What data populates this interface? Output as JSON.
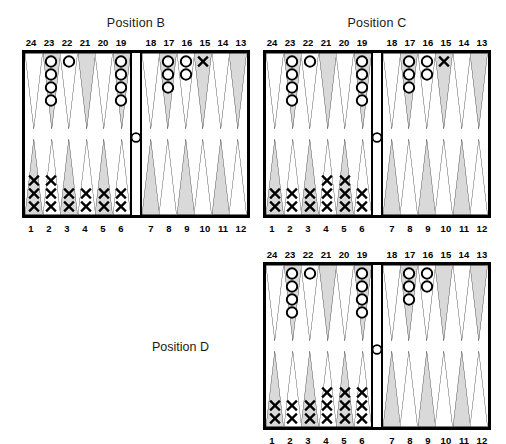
{
  "page": {
    "width": 506,
    "height": 444,
    "background": "#ffffff",
    "colors": {
      "ink": "#000000",
      "point_shaded": "#d9d9d9",
      "point_plain": "#ffffff",
      "board_border": "#000000",
      "checker_o": "#ffffff",
      "checker_x": "#000000"
    }
  },
  "top_point_numbers": [
    "24",
    "23",
    "22",
    "21",
    "20",
    "19",
    "18",
    "17",
    "16",
    "15",
    "14",
    "13"
  ],
  "bottom_point_numbers": [
    "1",
    "2",
    "3",
    "4",
    "5",
    "6",
    "7",
    "8",
    "9",
    "10",
    "11",
    "12"
  ],
  "boards": [
    {
      "id": "position-b",
      "title": "Position B",
      "title_placement": "above",
      "checkers": {
        "24": {
          "type": "",
          "count": 0
        },
        "23": {
          "type": "O",
          "count": 4
        },
        "22": {
          "type": "O",
          "count": 1
        },
        "21": {
          "type": "",
          "count": 0
        },
        "20": {
          "type": "",
          "count": 0
        },
        "19": {
          "type": "O",
          "count": 4
        },
        "18": {
          "type": "",
          "count": 0
        },
        "17": {
          "type": "O",
          "count": 3
        },
        "16": {
          "type": "O",
          "count": 2
        },
        "15": {
          "type": "X",
          "count": 1
        },
        "14": {
          "type": "",
          "count": 0
        },
        "13": {
          "type": "",
          "count": 0
        },
        "12": {
          "type": "",
          "count": 0
        },
        "11": {
          "type": "",
          "count": 0
        },
        "10": {
          "type": "",
          "count": 0
        },
        "9": {
          "type": "",
          "count": 0
        },
        "8": {
          "type": "",
          "count": 0
        },
        "7": {
          "type": "",
          "count": 0
        },
        "6": {
          "type": "X",
          "count": 2
        },
        "5": {
          "type": "X",
          "count": 2
        },
        "4": {
          "type": "X",
          "count": 2
        },
        "3": {
          "type": "X",
          "count": 2
        },
        "2": {
          "type": "X",
          "count": 3
        },
        "1": {
          "type": "X",
          "count": 3
        }
      },
      "bar": {
        "type": "O",
        "count": 1
      }
    },
    {
      "id": "position-c",
      "title": "Position C",
      "title_placement": "above",
      "checkers": {
        "24": {
          "type": "",
          "count": 0
        },
        "23": {
          "type": "O",
          "count": 4
        },
        "22": {
          "type": "O",
          "count": 1
        },
        "21": {
          "type": "",
          "count": 0
        },
        "20": {
          "type": "",
          "count": 0
        },
        "19": {
          "type": "O",
          "count": 4
        },
        "18": {
          "type": "",
          "count": 0
        },
        "17": {
          "type": "O",
          "count": 3
        },
        "16": {
          "type": "O",
          "count": 2
        },
        "15": {
          "type": "X",
          "count": 1
        },
        "14": {
          "type": "",
          "count": 0
        },
        "13": {
          "type": "",
          "count": 0
        },
        "12": {
          "type": "",
          "count": 0
        },
        "11": {
          "type": "",
          "count": 0
        },
        "10": {
          "type": "",
          "count": 0
        },
        "9": {
          "type": "",
          "count": 0
        },
        "8": {
          "type": "",
          "count": 0
        },
        "7": {
          "type": "",
          "count": 0
        },
        "6": {
          "type": "X",
          "count": 2
        },
        "5": {
          "type": "X",
          "count": 3
        },
        "4": {
          "type": "X",
          "count": 3
        },
        "3": {
          "type": "X",
          "count": 2
        },
        "2": {
          "type": "X",
          "count": 2
        },
        "1": {
          "type": "X",
          "count": 2
        }
      },
      "bar": {
        "type": "O",
        "count": 1
      }
    },
    {
      "id": "position-d",
      "title": "Position D",
      "title_placement": "left",
      "checkers": {
        "24": {
          "type": "",
          "count": 0
        },
        "23": {
          "type": "O",
          "count": 4
        },
        "22": {
          "type": "O",
          "count": 1
        },
        "21": {
          "type": "",
          "count": 0
        },
        "20": {
          "type": "",
          "count": 0
        },
        "19": {
          "type": "O",
          "count": 4
        },
        "18": {
          "type": "",
          "count": 0
        },
        "17": {
          "type": "O",
          "count": 3
        },
        "16": {
          "type": "O",
          "count": 2
        },
        "15": {
          "type": "",
          "count": 0
        },
        "14": {
          "type": "",
          "count": 0
        },
        "13": {
          "type": "",
          "count": 0
        },
        "12": {
          "type": "",
          "count": 0
        },
        "11": {
          "type": "",
          "count": 0
        },
        "10": {
          "type": "",
          "count": 0
        },
        "9": {
          "type": "",
          "count": 0
        },
        "8": {
          "type": "",
          "count": 0
        },
        "7": {
          "type": "",
          "count": 0
        },
        "6": {
          "type": "X",
          "count": 3
        },
        "5": {
          "type": "X",
          "count": 3
        },
        "4": {
          "type": "X",
          "count": 3
        },
        "3": {
          "type": "X",
          "count": 2
        },
        "2": {
          "type": "X",
          "count": 2
        },
        "1": {
          "type": "X",
          "count": 2
        }
      },
      "bar": {
        "type": "O",
        "count": 1
      }
    }
  ],
  "geometry": {
    "board_w": 228,
    "board_h": 168,
    "positions": {
      "position-b": {
        "left": 22,
        "top": 50
      },
      "position-c": {
        "left": 263,
        "top": 50
      },
      "position-d": {
        "left": 263,
        "top": 262
      }
    },
    "title_offsets": {
      "above_dy": -34,
      "numrow_top_dy": -14,
      "numrow_bot_dy": 4
    },
    "side_label": {
      "left": 152,
      "top": 340
    }
  }
}
